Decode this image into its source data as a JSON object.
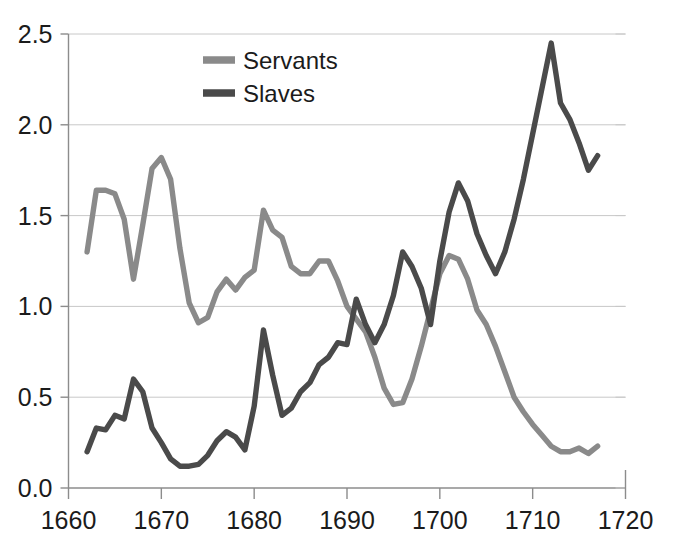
{
  "chart_data": {
    "type": "line",
    "title": "",
    "subtitle": "",
    "xlabel": "",
    "ylabel": "",
    "xlim": [
      1660,
      1720
    ],
    "ylim": [
      0.0,
      2.5
    ],
    "grid": true,
    "legend_position": "top-center",
    "x_tick_labels": [
      "1660",
      "1670",
      "1680",
      "1690",
      "1700",
      "1710",
      "1720"
    ],
    "x_ticks": [
      1660,
      1670,
      1680,
      1690,
      1700,
      1710,
      1720
    ],
    "y_tick_labels": [
      "0.0",
      "0.5",
      "1.0",
      "1.5",
      "2.0",
      "2.5"
    ],
    "y_ticks": [
      0.0,
      0.5,
      1.0,
      1.5,
      2.0,
      2.5
    ],
    "series": [
      {
        "name": "Servants",
        "color": "#8a8a8a",
        "x": [
          1662,
          1663,
          1664,
          1665,
          1666,
          1667,
          1668,
          1669,
          1670,
          1671,
          1672,
          1673,
          1674,
          1675,
          1676,
          1677,
          1678,
          1679,
          1680,
          1681,
          1682,
          1683,
          1684,
          1685,
          1686,
          1687,
          1688,
          1689,
          1690,
          1691,
          1692,
          1693,
          1694,
          1695,
          1696,
          1697,
          1698,
          1699,
          1700,
          1701,
          1702,
          1703,
          1704,
          1705,
          1706,
          1707,
          1708,
          1709,
          1710,
          1711,
          1712,
          1713,
          1714,
          1715,
          1716,
          1717
        ],
        "values": [
          1.3,
          1.64,
          1.64,
          1.62,
          1.48,
          1.15,
          1.45,
          1.76,
          1.82,
          1.7,
          1.32,
          1.02,
          0.91,
          0.94,
          1.08,
          1.15,
          1.09,
          1.16,
          1.2,
          1.53,
          1.42,
          1.38,
          1.22,
          1.18,
          1.18,
          1.25,
          1.25,
          1.14,
          1.0,
          0.93,
          0.86,
          0.72,
          0.55,
          0.46,
          0.47,
          0.6,
          0.78,
          0.98,
          1.18,
          1.28,
          1.26,
          1.15,
          0.98,
          0.9,
          0.78,
          0.64,
          0.5,
          0.42,
          0.35,
          0.29,
          0.23,
          0.2,
          0.2,
          0.22,
          0.19,
          0.23
        ]
      },
      {
        "name": "Slaves",
        "color": "#4a4a4a",
        "x": [
          1662,
          1663,
          1664,
          1665,
          1666,
          1667,
          1668,
          1669,
          1670,
          1671,
          1672,
          1673,
          1674,
          1675,
          1676,
          1677,
          1678,
          1679,
          1680,
          1681,
          1682,
          1683,
          1684,
          1685,
          1686,
          1687,
          1688,
          1689,
          1690,
          1691,
          1692,
          1693,
          1694,
          1695,
          1696,
          1697,
          1698,
          1699,
          1700,
          1701,
          1702,
          1703,
          1704,
          1705,
          1706,
          1707,
          1708,
          1709,
          1710,
          1711,
          1712,
          1713,
          1714,
          1715,
          1716,
          1717
        ],
        "values": [
          0.2,
          0.33,
          0.32,
          0.4,
          0.38,
          0.6,
          0.53,
          0.33,
          0.25,
          0.16,
          0.12,
          0.12,
          0.13,
          0.18,
          0.26,
          0.31,
          0.28,
          0.21,
          0.45,
          0.87,
          0.62,
          0.4,
          0.44,
          0.53,
          0.58,
          0.68,
          0.72,
          0.8,
          0.79,
          1.04,
          0.9,
          0.8,
          0.9,
          1.06,
          1.3,
          1.22,
          1.1,
          0.9,
          1.25,
          1.52,
          1.68,
          1.58,
          1.4,
          1.28,
          1.18,
          1.3,
          1.48,
          1.7,
          1.95,
          2.2,
          2.45,
          2.12,
          2.03,
          1.9,
          1.75,
          1.83
        ]
      }
    ]
  },
  "legend": {
    "items": [
      {
        "label": "Servants",
        "color": "#8a8a8a"
      },
      {
        "label": "Slaves",
        "color": "#4a4a4a"
      }
    ]
  }
}
